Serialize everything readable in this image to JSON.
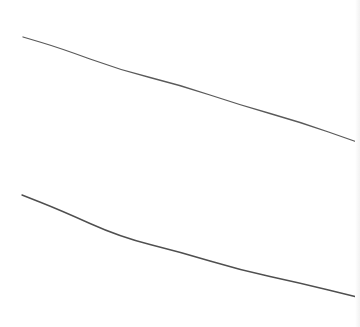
{
  "canvas": {
    "width": 360,
    "height": 327,
    "background": "#ffffff"
  },
  "strokes": [
    {
      "name": "upper-stroke",
      "color": "#5a5a5a",
      "width": 1.3,
      "points": [
        [
          23,
          37
        ],
        [
          60,
          48
        ],
        [
          120,
          70
        ],
        [
          180,
          85
        ],
        [
          240,
          105
        ],
        [
          300,
          122
        ],
        [
          357,
          142
        ]
      ]
    },
    {
      "name": "lower-stroke",
      "color": "#4f4f4f",
      "width": 1.4,
      "points": [
        [
          22,
          195
        ],
        [
          60,
          210
        ],
        [
          120,
          237
        ],
        [
          180,
          252
        ],
        [
          240,
          270
        ],
        [
          300,
          283
        ],
        [
          357,
          297
        ]
      ]
    }
  ],
  "edge_band": {
    "color": "#f2f2f2"
  }
}
